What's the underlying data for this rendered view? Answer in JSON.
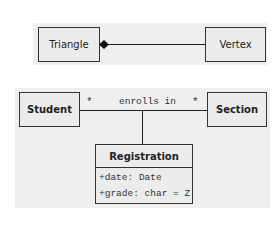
{
  "diagram": {
    "composition": {
      "whole": {
        "label": "Triangle"
      },
      "part": {
        "label": "Vertex"
      },
      "relationship": "composition"
    },
    "association": {
      "left": {
        "label": "Student",
        "multiplicity": "*"
      },
      "right": {
        "label": "Section",
        "multiplicity": "*"
      },
      "name": "enrolls in",
      "association_class": {
        "label": "Registration",
        "attributes": [
          "+date: Date",
          "+grade: char = Z"
        ]
      }
    }
  }
}
